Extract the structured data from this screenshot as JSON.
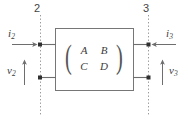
{
  "diagram": {
    "background_color": "#ffffff",
    "line_color": "#6e6e6e",
    "text_color": "#3c3c3c",
    "box": {
      "fill": "#ffffff",
      "stroke": "#767676"
    },
    "matrix": {
      "label": "ABCD matrix",
      "rows": [
        [
          "A",
          "B"
        ],
        [
          "C",
          "D"
        ]
      ],
      "open_paren": "(",
      "close_paren": ")"
    },
    "ports": [
      {
        "name": "left-port",
        "number": "2",
        "current_symbol": "i",
        "current_subscript": "2",
        "voltage_symbol": "v",
        "voltage_subscript": "2",
        "current_arrow_direction": "right",
        "voltage_arrow_direction": "up"
      },
      {
        "name": "right-port",
        "number": "3",
        "current_symbol": "i",
        "current_subscript": "3",
        "voltage_symbol": "v",
        "voltage_subscript": "3",
        "current_arrow_direction": "left",
        "voltage_arrow_direction": "up"
      }
    ]
  }
}
